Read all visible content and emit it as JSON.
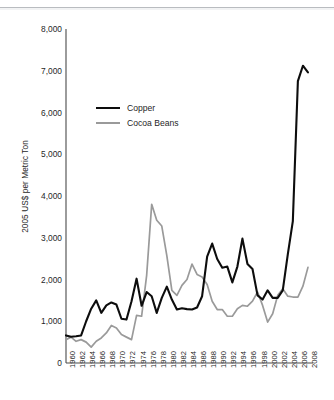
{
  "figure": {
    "name": "commodity-price-line-chart",
    "background": "#ffffff",
    "line_color_copper": "#0d0d0d",
    "line_color_cocoa": "#9a9a9a",
    "axis_color": "#4a4a4a"
  },
  "legend": {
    "position": "inside-upper-left",
    "entries": [
      {
        "label": "Copper",
        "color": "#0d0d0d"
      },
      {
        "label": "Cocoa Beans",
        "color": "#9a9a9a"
      }
    ]
  },
  "chart_data": {
    "type": "line",
    "title": "",
    "subtitle": "",
    "xlabel": "",
    "ylabel": "2005 US$ per Metric Ton",
    "xlim": [
      1960,
      2009
    ],
    "ylim": [
      0,
      8000
    ],
    "grid": false,
    "legend_position": "inside-upper-left",
    "ytick_labels": [
      "8,000",
      "7,000",
      "6,000",
      "5,000",
      "4,000",
      "3,000",
      "2,000",
      "1,000",
      "0"
    ],
    "ytick_values": [
      8000,
      7000,
      6000,
      5000,
      4000,
      3000,
      2000,
      1000,
      0
    ],
    "xtick_labels": [
      "1960",
      "1962",
      "1964",
      "1966",
      "1968",
      "1970",
      "1972",
      "1974",
      "1976",
      "1978",
      "1980",
      "1982",
      "1984",
      "1986",
      "1988",
      "1990",
      "1992",
      "1994",
      "1996",
      "1998",
      "2000",
      "2002",
      "2004",
      "2006",
      "2008"
    ],
    "xtick_values": [
      1960,
      1962,
      1964,
      1966,
      1968,
      1970,
      1972,
      1974,
      1976,
      1978,
      1980,
      1982,
      1984,
      1986,
      1988,
      1990,
      1992,
      1994,
      1996,
      1998,
      2000,
      2002,
      2004,
      2006,
      2008
    ],
    "x": [
      1960,
      1961,
      1962,
      1963,
      1964,
      1965,
      1966,
      1967,
      1968,
      1969,
      1970,
      1971,
      1972,
      1973,
      1974,
      1975,
      1976,
      1977,
      1978,
      1979,
      1980,
      1981,
      1982,
      1983,
      1984,
      1985,
      1986,
      1987,
      1988,
      1989,
      1990,
      1991,
      1992,
      1993,
      1994,
      1995,
      1996,
      1997,
      1998,
      1999,
      2000,
      2001,
      2002,
      2003,
      2004,
      2005,
      2006,
      2007,
      2008
    ],
    "series": [
      {
        "name": "Copper",
        "color": "#0d0d0d",
        "values": [
          660,
          630,
          640,
          660,
          1000,
          1300,
          1500,
          1200,
          1380,
          1450,
          1400,
          1060,
          1040,
          1480,
          2020,
          1370,
          1700,
          1600,
          1200,
          1560,
          1830,
          1520,
          1280,
          1310,
          1290,
          1280,
          1330,
          1600,
          2550,
          2860,
          2490,
          2280,
          2310,
          1930,
          2310,
          2980,
          2370,
          2250,
          1620,
          1520,
          1740,
          1560,
          1560,
          1740,
          2600,
          3400,
          6750,
          7120,
          6960
        ]
      },
      {
        "name": "Cocoa Beans",
        "color": "#9a9a9a",
        "values": [
          560,
          620,
          520,
          560,
          500,
          380,
          520,
          600,
          720,
          900,
          840,
          680,
          620,
          560,
          1140,
          1120,
          2100,
          3800,
          3420,
          3280,
          2570,
          1740,
          1620,
          1860,
          2000,
          2370,
          2120,
          2060,
          1880,
          1480,
          1280,
          1280,
          1120,
          1120,
          1300,
          1380,
          1360,
          1480,
          1700,
          1380,
          980,
          1180,
          1620,
          1780,
          1600,
          1580,
          1580,
          1840,
          2290
        ]
      }
    ]
  }
}
